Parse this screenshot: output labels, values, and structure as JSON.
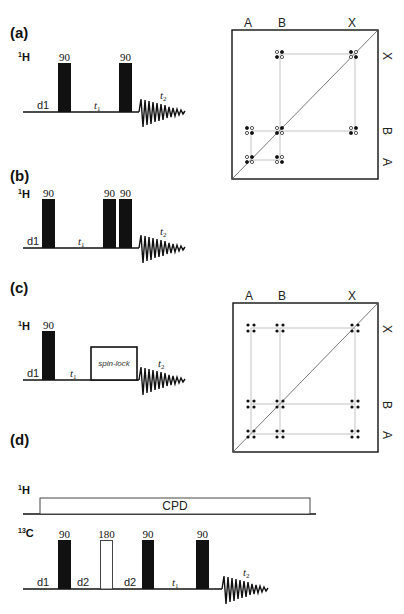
{
  "figure": {
    "panels": [
      {
        "id": "a",
        "label": "(a)",
        "nucleus": {
          "mass": "1",
          "symbol": "H"
        },
        "pulses": [
          {
            "label": "90",
            "type": "filled"
          },
          {
            "label": "90",
            "type": "filled"
          }
        ],
        "delays": [
          "d1",
          "t",
          "1"
        ],
        "acquisition": {
          "label": "t",
          "sub": "2"
        }
      },
      {
        "id": "b",
        "label": "(b)",
        "nucleus": {
          "mass": "1",
          "symbol": "H"
        },
        "pulses": [
          {
            "label": "90",
            "type": "filled"
          },
          {
            "label": "90",
            "type": "filled"
          },
          {
            "label": "90",
            "type": "filled"
          }
        ],
        "delays": [
          "d1",
          "t",
          "1"
        ],
        "acquisition": {
          "label": "t",
          "sub": "2"
        }
      },
      {
        "id": "c",
        "label": "(c)",
        "nucleus": {
          "mass": "1",
          "symbol": "H"
        },
        "pulses": [
          {
            "label": "90",
            "type": "filled"
          }
        ],
        "spin_lock": "spin-lock",
        "delays": [
          "d1",
          "t",
          "1"
        ],
        "acquisition": {
          "label": "t",
          "sub": "2"
        }
      },
      {
        "id": "d",
        "label": "(d)",
        "decoupling_channel": {
          "mass": "1",
          "symbol": "H",
          "block": "CPD"
        },
        "nucleus": {
          "mass": "13",
          "symbol": "C"
        },
        "pulses": [
          {
            "label": "90",
            "type": "filled"
          },
          {
            "label": "180",
            "type": "open"
          },
          {
            "label": "90",
            "type": "filled"
          },
          {
            "label": "90",
            "type": "filled"
          }
        ],
        "delays": [
          "d1",
          "d2",
          "d2",
          "t",
          "1"
        ],
        "acquisition": {
          "label": "t",
          "sub": "2"
        }
      }
    ],
    "spectra": [
      {
        "id": "spectrum-a",
        "top_labels": [
          "A",
          "B",
          "X"
        ],
        "side_labels": [
          "X",
          "B",
          "A"
        ],
        "peak_style": "antiphase (filled/open)"
      },
      {
        "id": "spectrum-c",
        "top_labels": [
          "A",
          "B",
          "X"
        ],
        "side_labels": [
          "X",
          "B",
          "A"
        ],
        "peak_style": "in-phase (all filled)"
      }
    ]
  }
}
